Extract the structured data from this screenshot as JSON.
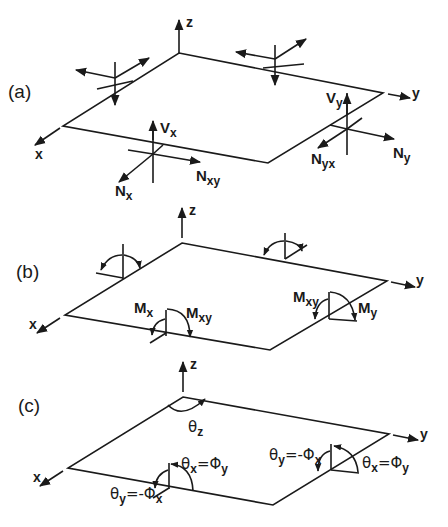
{
  "figure": {
    "panels": [
      {
        "id": "a",
        "label": "(a)",
        "axes": {
          "x": "x",
          "y": "y",
          "z": "z"
        },
        "forces": [
          {
            "id": "vx",
            "main": "V",
            "sub": "x"
          },
          {
            "id": "nx",
            "main": "N",
            "sub": "x"
          },
          {
            "id": "nxy",
            "main": "N",
            "sub": "xy"
          },
          {
            "id": "vy",
            "main": "V",
            "sub": "y"
          },
          {
            "id": "ny",
            "main": "N",
            "sub": "y"
          },
          {
            "id": "nyx",
            "main": "N",
            "sub": "yx"
          }
        ]
      },
      {
        "id": "b",
        "label": "(b)",
        "axes": {
          "x": "x",
          "y": "y",
          "z": "z"
        },
        "moments": [
          {
            "id": "mx",
            "main": "M",
            "sub": "x"
          },
          {
            "id": "mxy_front",
            "main": "M",
            "sub": "xy"
          },
          {
            "id": "mxy_right",
            "main": "M",
            "sub": "xy"
          },
          {
            "id": "my",
            "main": "M",
            "sub": "y"
          }
        ]
      },
      {
        "id": "c",
        "label": "(c)",
        "axes": {
          "x": "x",
          "y": "y",
          "z": "z"
        },
        "rotations": [
          {
            "id": "theta_z",
            "main": "θ",
            "sub": "z"
          },
          {
            "id": "thx_front",
            "lhs": "θ",
            "lhs_sub": "x",
            "op": "=",
            "rhs": "Φ",
            "rhs_sub": "y"
          },
          {
            "id": "thy_front",
            "lhs": "θ",
            "lhs_sub": "y",
            "op": "=-",
            "rhs": "Φ",
            "rhs_sub": "x"
          },
          {
            "id": "thy_right",
            "lhs": "θ",
            "lhs_sub": "y",
            "op": "=-",
            "rhs": "Φ",
            "rhs_sub": "x"
          },
          {
            "id": "thx_right",
            "lhs": "θ",
            "lhs_sub": "x",
            "op": "=",
            "rhs": "Φ",
            "rhs_sub": "y"
          }
        ]
      }
    ]
  }
}
